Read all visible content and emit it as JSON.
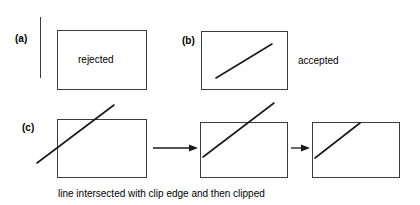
{
  "figure": {
    "width": 420,
    "height": 205,
    "background": "#ffffff",
    "stroke_color": "#3b3b3b",
    "line_color": "#1a1a1a",
    "text_color": "#000000",
    "caption": "line intersected with clip edge and then clipped"
  },
  "panels": [
    {
      "id": "a",
      "label": "(a)",
      "box_label": "rejected",
      "description": "clip window with no line inside"
    },
    {
      "id": "b",
      "label": "(b)",
      "side_label": "accepted",
      "description": "clip window with line fully inside"
    },
    {
      "id": "c",
      "label": "(c)",
      "description": "sequence of three clip windows joined by arrows"
    }
  ],
  "labels": {
    "panel_a": "(a)",
    "panel_b": "(b)",
    "panel_c": "(c)",
    "rejected": "rejected",
    "accepted": "accepted",
    "caption": "line intersected with clip edge and then clipped"
  },
  "arrows": {
    "first": "arrow-right",
    "second": "arrow-right"
  }
}
